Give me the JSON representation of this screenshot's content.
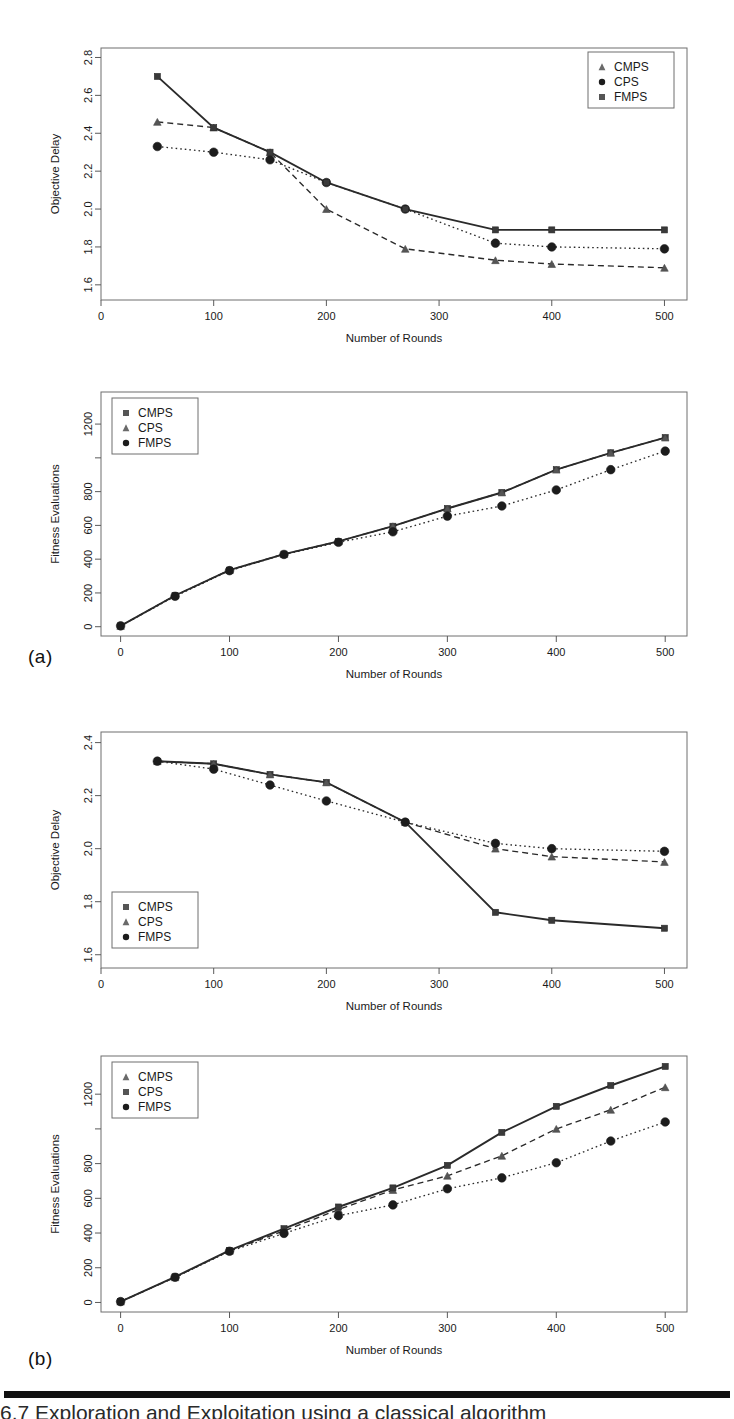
{
  "figure": {
    "panel_a_letter": "(a)",
    "panel_b_letter": "(b)",
    "caption_partial": "6.7   Exploration and Exploitation using a classical algorithm"
  },
  "series_names": {
    "cmps": "CMPS",
    "cps": "CPS",
    "fmps": "FMPS"
  },
  "chart_data": [
    {
      "id": "a-top",
      "type": "line",
      "title": "",
      "xlabel": "Number of Rounds",
      "ylabel": "Objective Delay",
      "xlim": [
        0,
        520
      ],
      "ylim": [
        1.52,
        2.85
      ],
      "xticks": [
        0,
        100,
        200,
        300,
        400,
        500
      ],
      "yticks": [
        1.6,
        1.8,
        2.0,
        2.2,
        2.4,
        2.6,
        2.8
      ],
      "ytick_labels": [
        "1.6",
        "1.8",
        "2.0",
        "2.2",
        "2.4",
        "2.6",
        "2.8"
      ],
      "xtick_labels": [
        "0",
        "100",
        "200",
        "300",
        "400",
        "500"
      ],
      "grid": false,
      "legend_position": "top-right",
      "legend_order": [
        "CMPS",
        "CPS",
        "FMPS"
      ],
      "legend_markers": [
        "triangle",
        "circle",
        "square"
      ],
      "series": [
        {
          "name": "CMPS",
          "marker": "triangle",
          "line": "dashed",
          "x": [
            50,
            100,
            150,
            200,
            270,
            350,
            400,
            500
          ],
          "values": [
            2.46,
            2.43,
            2.3,
            2.0,
            1.79,
            1.73,
            1.71,
            1.69
          ]
        },
        {
          "name": "CPS",
          "marker": "circle",
          "line": "dotted",
          "x": [
            50,
            100,
            150,
            200,
            270,
            350,
            400,
            500
          ],
          "values": [
            2.33,
            2.3,
            2.26,
            2.14,
            2.0,
            1.82,
            1.8,
            1.79
          ]
        },
        {
          "name": "FMPS",
          "marker": "square",
          "line": "solid",
          "x": [
            50,
            100,
            150,
            200,
            270,
            350,
            400,
            500
          ],
          "values": [
            2.7,
            2.43,
            2.3,
            2.14,
            2.0,
            1.89,
            1.89,
            1.89
          ]
        }
      ]
    },
    {
      "id": "a-bottom",
      "type": "line",
      "title": "",
      "xlabel": "Number of Rounds",
      "ylabel": "Fitness Evaluations",
      "xlim": [
        -18,
        520
      ],
      "ylim": [
        -55,
        1390
      ],
      "xticks": [
        0,
        100,
        200,
        300,
        400,
        500
      ],
      "yticks": [
        0,
        200,
        400,
        600,
        800,
        1000,
        1200
      ],
      "ytick_labels": [
        "0",
        "200",
        "400",
        "600",
        "800",
        "",
        "1200"
      ],
      "xtick_labels": [
        "0",
        "100",
        "200",
        "300",
        "400",
        "500"
      ],
      "grid": false,
      "legend_position": "top-left",
      "legend_order": [
        "CMPS",
        "CPS",
        "FMPS"
      ],
      "legend_markers": [
        "square",
        "triangle",
        "circle"
      ],
      "series": [
        {
          "name": "CMPS",
          "marker": "square",
          "line": "solid",
          "x": [
            0,
            50,
            100,
            150,
            200,
            250,
            300,
            350,
            400,
            450,
            500
          ],
          "values": [
            5,
            185,
            335,
            430,
            505,
            595,
            700,
            795,
            930,
            1030,
            1120
          ]
        },
        {
          "name": "CPS",
          "marker": "triangle",
          "line": "dashed",
          "x": [
            0,
            50,
            100,
            150,
            200,
            250,
            300,
            350,
            400,
            450,
            500
          ],
          "values": [
            5,
            185,
            335,
            430,
            505,
            595,
            700,
            795,
            930,
            1030,
            1120
          ]
        },
        {
          "name": "FMPS",
          "marker": "circle",
          "line": "dotted",
          "x": [
            0,
            50,
            100,
            150,
            200,
            250,
            300,
            350,
            400,
            450,
            500
          ],
          "values": [
            5,
            180,
            332,
            428,
            500,
            562,
            655,
            715,
            810,
            930,
            1040
          ]
        }
      ]
    },
    {
      "id": "b-top",
      "type": "line",
      "title": "",
      "xlabel": "Number of Rounds",
      "ylabel": "Objective Delay",
      "xlim": [
        0,
        520
      ],
      "ylim": [
        1.55,
        2.44
      ],
      "xticks": [
        0,
        100,
        200,
        300,
        400,
        500
      ],
      "yticks": [
        1.6,
        1.8,
        2.0,
        2.2,
        2.4
      ],
      "ytick_labels": [
        "1.6",
        "1.8",
        "2.0",
        "2.2",
        "2.4"
      ],
      "xtick_labels": [
        "0",
        "100",
        "200",
        "300",
        "400",
        "500"
      ],
      "grid": false,
      "legend_position": "bottom-left",
      "legend_order": [
        "CMPS",
        "CPS",
        "FMPS"
      ],
      "legend_markers": [
        "square",
        "triangle",
        "circle"
      ],
      "series": [
        {
          "name": "CMPS",
          "marker": "square",
          "line": "solid",
          "x": [
            50,
            100,
            150,
            200,
            270,
            350,
            400,
            500
          ],
          "values": [
            2.33,
            2.32,
            2.28,
            2.25,
            2.1,
            1.76,
            1.73,
            1.7
          ]
        },
        {
          "name": "CPS",
          "marker": "triangle",
          "line": "dashed",
          "x": [
            50,
            100,
            150,
            200,
            270,
            350,
            400,
            500
          ],
          "values": [
            2.33,
            2.32,
            2.28,
            2.25,
            2.1,
            2.0,
            1.97,
            1.95
          ]
        },
        {
          "name": "FMPS",
          "marker": "circle",
          "line": "dotted",
          "x": [
            50,
            100,
            150,
            200,
            270,
            350,
            400,
            500
          ],
          "values": [
            2.33,
            2.3,
            2.24,
            2.18,
            2.1,
            2.02,
            2.0,
            1.99
          ]
        }
      ]
    },
    {
      "id": "b-bottom",
      "type": "line",
      "title": "",
      "xlabel": "Number of Rounds",
      "ylabel": "Fitness Evaluations",
      "xlim": [
        -18,
        520
      ],
      "ylim": [
        -55,
        1420
      ],
      "xticks": [
        0,
        100,
        200,
        300,
        400,
        500
      ],
      "yticks": [
        0,
        200,
        400,
        600,
        800,
        1000,
        1200
      ],
      "ytick_labels": [
        "0",
        "200",
        "400",
        "600",
        "800",
        "",
        "1200"
      ],
      "xtick_labels": [
        "0",
        "100",
        "200",
        "300",
        "400",
        "500"
      ],
      "grid": false,
      "legend_position": "top-left",
      "legend_order": [
        "CMPS",
        "CPS",
        "FMPS"
      ],
      "legend_markers": [
        "triangle",
        "square",
        "circle"
      ],
      "series": [
        {
          "name": "CMPS",
          "marker": "triangle",
          "line": "dashed",
          "x": [
            0,
            50,
            100,
            150,
            200,
            250,
            300,
            350,
            400,
            450,
            500
          ],
          "values": [
            5,
            145,
            298,
            412,
            535,
            648,
            730,
            845,
            1000,
            1110,
            1240
          ]
        },
        {
          "name": "CPS",
          "marker": "square",
          "line": "solid",
          "x": [
            0,
            50,
            100,
            150,
            200,
            250,
            300,
            350,
            400,
            450,
            500
          ],
          "values": [
            5,
            148,
            300,
            425,
            550,
            660,
            790,
            980,
            1130,
            1250,
            1360
          ]
        },
        {
          "name": "FMPS",
          "marker": "circle",
          "line": "dotted",
          "x": [
            0,
            50,
            100,
            150,
            200,
            250,
            300,
            350,
            400,
            450,
            500
          ],
          "values": [
            5,
            145,
            295,
            398,
            500,
            562,
            655,
            718,
            805,
            930,
            1040
          ]
        }
      ]
    }
  ]
}
